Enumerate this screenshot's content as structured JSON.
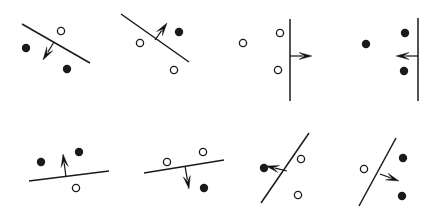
{
  "figure": {
    "title": "",
    "width": 433,
    "height": 219,
    "background_color": "#ffffff",
    "colors": {
      "line": "#1a1a1a",
      "arrow": "#111111",
      "filled_point": "#1a1a1a",
      "open_point_stroke": "#1a1a1a",
      "open_point_fill": "#ffffff"
    },
    "marker": {
      "filled_radius": 4.2,
      "open_radius": 3.6,
      "open_stroke_width": 1.3
    },
    "panels": [
      {
        "id": "panel-1",
        "row": 1,
        "column": 1,
        "line": {
          "x1": 22,
          "y1": 24,
          "x2": 90,
          "y2": 63
        },
        "arrow": {
          "x1": 54,
          "y1": 42,
          "x2": 43,
          "y2": 60,
          "direction": "down-left"
        },
        "points": [
          {
            "type": "open",
            "cx": 61,
            "cy": 31
          },
          {
            "type": "filled",
            "cx": 26,
            "cy": 48
          },
          {
            "type": "filled",
            "cx": 67,
            "cy": 69
          }
        ]
      },
      {
        "id": "panel-2",
        "row": 1,
        "column": 2,
        "line": {
          "x1": 121,
          "y1": 14,
          "x2": 189,
          "y2": 62
        },
        "arrow": {
          "x1": 155,
          "y1": 40,
          "x2": 167,
          "y2": 23,
          "direction": "up-right"
        },
        "points": [
          {
            "type": "filled",
            "cx": 179,
            "cy": 32
          },
          {
            "type": "open",
            "cx": 140,
            "cy": 43
          },
          {
            "type": "open",
            "cx": 174,
            "cy": 70
          }
        ]
      },
      {
        "id": "panel-3",
        "row": 1,
        "column": 3,
        "line": {
          "x1": 290,
          "y1": 19,
          "x2": 290,
          "y2": 101
        },
        "arrow": {
          "x1": 290,
          "y1": 56,
          "x2": 312,
          "y2": 56,
          "direction": "right"
        },
        "points": [
          {
            "type": "open",
            "cx": 243,
            "cy": 43
          },
          {
            "type": "open",
            "cx": 280,
            "cy": 33
          },
          {
            "type": "open",
            "cx": 278,
            "cy": 70
          }
        ]
      },
      {
        "id": "panel-4",
        "row": 1,
        "column": 4,
        "line": {
          "x1": 418,
          "y1": 18,
          "x2": 418,
          "y2": 101
        },
        "arrow": {
          "x1": 418,
          "y1": 56,
          "x2": 396,
          "y2": 56,
          "direction": "left"
        },
        "points": [
          {
            "type": "filled",
            "cx": 366,
            "cy": 44
          },
          {
            "type": "filled",
            "cx": 405,
            "cy": 33
          },
          {
            "type": "filled",
            "cx": 404,
            "cy": 71
          }
        ]
      },
      {
        "id": "panel-5",
        "row": 2,
        "column": 1,
        "line": {
          "x1": 29,
          "y1": 181,
          "x2": 109,
          "y2": 171
        },
        "arrow": {
          "x1": 66,
          "y1": 177,
          "x2": 63,
          "y2": 154,
          "direction": "up"
        },
        "points": [
          {
            "type": "filled",
            "cx": 41,
            "cy": 162
          },
          {
            "type": "filled",
            "cx": 79,
            "cy": 152
          },
          {
            "type": "open",
            "cx": 76,
            "cy": 188
          }
        ]
      },
      {
        "id": "panel-6",
        "row": 2,
        "column": 2,
        "line": {
          "x1": 144,
          "y1": 173,
          "x2": 224,
          "y2": 160
        },
        "arrow": {
          "x1": 185,
          "y1": 166,
          "x2": 189,
          "y2": 189,
          "direction": "down"
        },
        "points": [
          {
            "type": "open",
            "cx": 167,
            "cy": 162
          },
          {
            "type": "open",
            "cx": 203,
            "cy": 152
          },
          {
            "type": "filled",
            "cx": 204,
            "cy": 188
          }
        ]
      },
      {
        "id": "panel-7",
        "row": 2,
        "column": 3,
        "line": {
          "x1": 261,
          "y1": 203,
          "x2": 309,
          "y2": 133
        },
        "arrow": {
          "x1": 287,
          "y1": 171,
          "x2": 266,
          "y2": 166,
          "direction": "left"
        },
        "points": [
          {
            "type": "filled",
            "cx": 264,
            "cy": 168
          },
          {
            "type": "open",
            "cx": 301,
            "cy": 159
          },
          {
            "type": "open",
            "cx": 298,
            "cy": 195
          }
        ]
      },
      {
        "id": "panel-8",
        "row": 2,
        "column": 4,
        "line": {
          "x1": 359,
          "y1": 206,
          "x2": 396,
          "y2": 138
        },
        "arrow": {
          "x1": 380,
          "y1": 174,
          "x2": 399,
          "y2": 181,
          "direction": "right-down"
        },
        "points": [
          {
            "type": "open",
            "cx": 364,
            "cy": 169
          },
          {
            "type": "filled",
            "cx": 403,
            "cy": 158
          },
          {
            "type": "filled",
            "cx": 402,
            "cy": 196
          }
        ]
      }
    ]
  }
}
